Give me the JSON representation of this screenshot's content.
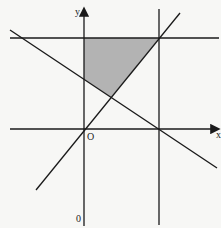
{
  "diagram": {
    "type": "coordinate-plane-feasible-region",
    "axes": {
      "x_label": "x",
      "y_label": "y",
      "origin_label": "O",
      "bottom_label": "0"
    },
    "colors": {
      "background": "#f7f7f5",
      "line": "#1a1a1a",
      "shaded_region": "#b3b3b3"
    },
    "lines": [
      {
        "name": "x-axis",
        "from": [
          10,
          129
        ],
        "to": [
          218,
          129
        ],
        "arrow": true
      },
      {
        "name": "y-axis",
        "from": [
          84,
          226
        ],
        "to": [
          84,
          9
        ],
        "arrow": true
      },
      {
        "name": "horizontal-line-top",
        "from": [
          10,
          38
        ],
        "to": [
          219,
          38
        ]
      },
      {
        "name": "vertical-line-right",
        "from": [
          159,
          9
        ],
        "to": [
          159,
          225
        ]
      },
      {
        "name": "falling-line",
        "from": [
          10,
          30
        ],
        "to": [
          217,
          168
        ]
      },
      {
        "name": "rising-line",
        "from": [
          36,
          190
        ],
        "to": [
          180,
          13
        ]
      }
    ],
    "shaded_region": {
      "vertices": [
        [
          84,
          38
        ],
        [
          159,
          38
        ],
        [
          111,
          97
        ],
        [
          84,
          79
        ]
      ]
    }
  }
}
